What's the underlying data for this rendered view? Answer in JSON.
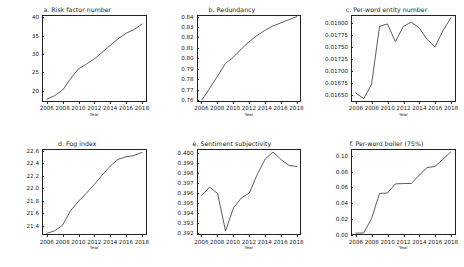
{
  "figure": {
    "xlabel": "Year",
    "line_color": "#3f3f4a",
    "background": "#ffffff"
  },
  "chart_data": [
    {
      "type": "line",
      "title": "a. Risk factor number",
      "xlabel": "Year",
      "ylabel": "",
      "x": [
        2006,
        2007,
        2008,
        2009,
        2010,
        2011,
        2012,
        2013,
        2014,
        2015,
        2016,
        2017,
        2018
      ],
      "values": [
        17.6,
        18.6,
        20.1,
        23.2,
        25.9,
        27.2,
        28.6,
        30.4,
        32.3,
        34.1,
        35.6,
        36.6,
        38.1
      ],
      "xticks": [
        2006,
        2008,
        2010,
        2012,
        2014,
        2016,
        2018
      ],
      "yticks": [
        20,
        25,
        30,
        35,
        40
      ],
      "ylim": [
        17.0,
        40.6
      ],
      "xlim": [
        2005.4,
        2018.6
      ],
      "grid": false,
      "legend": "none"
    },
    {
      "type": "line",
      "title": "b. Redundancy",
      "xlabel": "Year",
      "ylabel": "",
      "x": [
        2006,
        2007,
        2008,
        2009,
        2010,
        2011,
        2012,
        2013,
        2014,
        2015,
        2016,
        2017,
        2018
      ],
      "values": [
        0.76,
        0.771,
        0.783,
        0.795,
        0.801,
        0.809,
        0.816,
        0.822,
        0.827,
        0.831,
        0.834,
        0.837,
        0.84
      ],
      "xticks": [
        2006,
        2008,
        2010,
        2012,
        2014,
        2016,
        2018
      ],
      "yticks": [
        "0.76",
        "0.77",
        "0.78",
        "0.79",
        "0.80",
        "0.81",
        "0.82",
        "0.83",
        "0.84"
      ],
      "ylim": [
        0.7585,
        0.8415
      ],
      "xlim": [
        2005.4,
        2018.6
      ],
      "grid": false,
      "legend": "none"
    },
    {
      "type": "line",
      "title": "c. Per-word entity number",
      "xlabel": "Year",
      "ylabel": "",
      "x": [
        2006,
        2007,
        2008,
        2009,
        2010,
        2011,
        2012,
        2013,
        2014,
        2015,
        2016,
        2017,
        2018
      ],
      "values": [
        0.01654,
        0.01642,
        0.01672,
        0.01793,
        0.017985,
        0.01761,
        0.01793,
        0.01802,
        0.0179,
        0.01766,
        0.0175,
        0.01784,
        0.01811
      ],
      "xticks": [
        2006,
        2008,
        2010,
        2012,
        2014,
        2016,
        2018
      ],
      "yticks": [
        "0.01650",
        "0.01675",
        "0.01700",
        "0.01725",
        "0.01750",
        "0.01775",
        "0.01800"
      ],
      "ylim": [
        0.01636,
        0.01817
      ],
      "xlim": [
        2005.4,
        2018.6
      ],
      "grid": false,
      "legend": "none"
    },
    {
      "type": "line",
      "title": "d. Fog index",
      "xlabel": "Year",
      "ylabel": "",
      "x": [
        2006,
        2007,
        2008,
        2009,
        2010,
        2011,
        2012,
        2013,
        2014,
        2015,
        2016,
        2017,
        2018
      ],
      "values": [
        21.29,
        21.33,
        21.42,
        21.65,
        21.8,
        21.93,
        22.07,
        22.22,
        22.36,
        22.47,
        22.51,
        22.53,
        22.58
      ],
      "xticks": [
        2006,
        2008,
        2010,
        2012,
        2014,
        2016,
        2018
      ],
      "yticks": [
        "21.4",
        "21.6",
        "21.8",
        "22.0",
        "22.2",
        "22.4",
        "22.6"
      ],
      "ylim": [
        21.255,
        22.635
      ],
      "xlim": [
        2005.4,
        2018.6
      ],
      "grid": false,
      "legend": "none"
    },
    {
      "type": "line",
      "title": "e. Sentiment subjectivity",
      "xlabel": "Year",
      "ylabel": "",
      "x": [
        2006,
        2007,
        2008,
        2009,
        2010,
        2011,
        2012,
        2013,
        2014,
        2015,
        2016,
        2017,
        2018
      ],
      "values": [
        0.3958,
        0.39665,
        0.396,
        0.39225,
        0.39455,
        0.39555,
        0.39605,
        0.3979,
        0.39945,
        0.40015,
        0.3994,
        0.3988,
        0.3987
      ],
      "xticks": [
        2006,
        2008,
        2010,
        2012,
        2014,
        2016,
        2018
      ],
      "yticks": [
        "0.392",
        "0.393",
        "0.394",
        "0.395",
        "0.396",
        "0.397",
        "0.398",
        "0.399",
        "0.400"
      ],
      "ylim": [
        0.3918,
        0.40045
      ],
      "xlim": [
        2005.4,
        2018.6
      ],
      "grid": false,
      "legend": "none"
    },
    {
      "type": "line",
      "title": "f. Per-word boiler (75%)",
      "xlabel": "Year",
      "ylabel": "",
      "x": [
        2006,
        2007,
        2008,
        2009,
        2010,
        2011,
        2012,
        2013,
        2014,
        2015,
        2016,
        2017,
        2018
      ],
      "values": [
        0.003,
        0.0032,
        0.0215,
        0.053,
        0.0535,
        0.065,
        0.0655,
        0.0655,
        0.076,
        0.0855,
        0.087,
        0.096,
        0.1055
      ],
      "xticks": [
        2006,
        2008,
        2010,
        2012,
        2014,
        2016,
        2018
      ],
      "yticks": [
        "0.00",
        "0.02",
        "0.04",
        "0.06",
        "0.08",
        "0.10"
      ],
      "ylim": [
        0.0,
        0.109
      ],
      "xlim": [
        2005.4,
        2018.6
      ],
      "grid": false,
      "legend": "none"
    }
  ]
}
